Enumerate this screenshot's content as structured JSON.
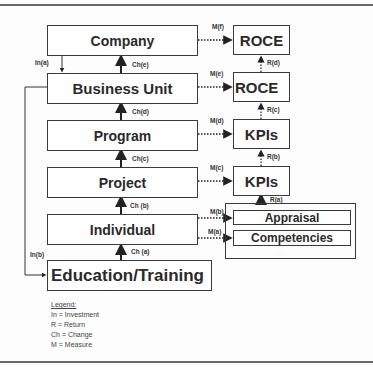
{
  "hierarchy": [
    {
      "id": "company",
      "label": "Company"
    },
    {
      "id": "business_unit",
      "label": "Business Unit"
    },
    {
      "id": "program",
      "label": "Program"
    },
    {
      "id": "project",
      "label": "Project"
    },
    {
      "id": "individual",
      "label": "Individual"
    },
    {
      "id": "education",
      "label": "Education/Training"
    }
  ],
  "metrics": [
    {
      "id": "roce_top",
      "label": "ROCE"
    },
    {
      "id": "roce_bu",
      "label": "ROCE"
    },
    {
      "id": "kpis_program",
      "label": "KPIs"
    },
    {
      "id": "kpis_project",
      "label": "KPIs"
    },
    {
      "id": "appraisal",
      "label": "Appraisal"
    },
    {
      "id": "competencies",
      "label": "Competencies"
    }
  ],
  "change_labels": {
    "a": "Ch (a)",
    "b": "Ch (b)",
    "c": "Ch(c)",
    "d": "Ch(d)",
    "e": "Ch(e)"
  },
  "measure_labels": {
    "a": "M(a)",
    "b": "M(b)",
    "c": "M(c)",
    "d": "M(d)",
    "e": "M(e)",
    "f": "M(f)"
  },
  "return_labels": {
    "a": "R(a)",
    "b": "R(b)",
    "c": "R(c)",
    "d": "R(d)"
  },
  "investment_labels": {
    "a": "In(a)",
    "b": "In(b)"
  },
  "legend": {
    "title": "Legend:",
    "items": [
      "In = Investment",
      "R = Return",
      "Ch = Change",
      "M = Measure"
    ]
  }
}
